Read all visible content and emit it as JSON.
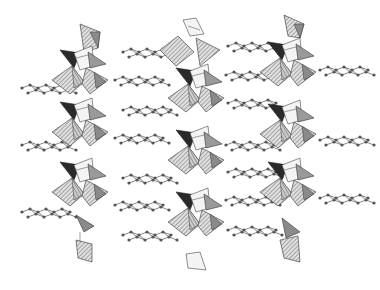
{
  "figure": {
    "title": "",
    "background": "#ffffff",
    "colors": {
      "hatched_fill": "#bdbdbd",
      "light_fill": "#f2f2f2",
      "mid_fill": "#8a8a8a",
      "dark_fill": "#2a2a2a",
      "edge": "#3a3a3a",
      "atom": "#555555"
    },
    "columns": [
      {
        "id": "chain-left",
        "cx": 70,
        "top": 15,
        "bottom": 262
      },
      {
        "id": "chain-center",
        "cx": 195,
        "top": 18,
        "bottom": 270
      },
      {
        "id": "chain-right",
        "cx": 287,
        "top": 15,
        "bottom": 262
      }
    ],
    "ligand_layers": [
      {
        "x": 22,
        "y": 88
      },
      {
        "x": 115,
        "y": 82
      },
      {
        "x": 123,
        "y": 52
      },
      {
        "x": 228,
        "y": 48
      },
      {
        "x": 123,
        "y": 110
      },
      {
        "x": 228,
        "y": 103
      },
      {
        "x": 22,
        "y": 145
      },
      {
        "x": 115,
        "y": 140
      },
      {
        "x": 123,
        "y": 178
      },
      {
        "x": 228,
        "y": 175
      },
      {
        "x": 22,
        "y": 212
      },
      {
        "x": 115,
        "y": 205
      },
      {
        "x": 123,
        "y": 235
      },
      {
        "x": 228,
        "y": 232
      },
      {
        "x": 225,
        "y": 75
      },
      {
        "x": 320,
        "y": 70
      },
      {
        "x": 225,
        "y": 200
      },
      {
        "x": 320,
        "y": 200
      },
      {
        "x": 225,
        "y": 145
      },
      {
        "x": 320,
        "y": 140
      },
      {
        "x": 20,
        "y": 40
      },
      {
        "x": 320,
        "y": 48
      }
    ]
  }
}
